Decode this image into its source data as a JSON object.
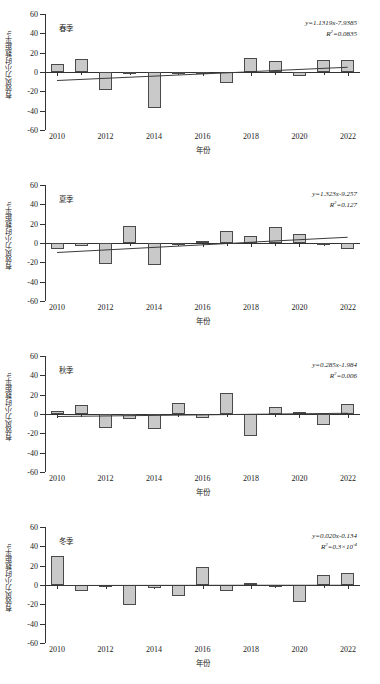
{
  "figure": {
    "y_axis_label": "有效风力小时数距平/h",
    "x_axis_label": "年份",
    "y_ticks": [
      "60",
      "40",
      "20",
      "0",
      "-20",
      "-40",
      "-60"
    ],
    "x_ticks": [
      "2010",
      "2012",
      "2014",
      "2016",
      "2018",
      "2020",
      "2022"
    ],
    "bar_fill": "#c9c9c9",
    "bar_stroke": "#4a4a4a",
    "trend_color": "#3b3b3b"
  },
  "chart_data": [
    {
      "type": "bar",
      "title": "春季",
      "equation": "y=1.1319x-7.9385",
      "r_squared_label": "R",
      "r_squared_value": "=0.0835",
      "xlabel": "年份",
      "ylabel": "有效风力小时数距平/h",
      "ylim": [
        -60,
        60
      ],
      "grid": false,
      "categories": [
        2010,
        2011,
        2012,
        2013,
        2014,
        2015,
        2016,
        2017,
        2018,
        2019,
        2020,
        2021,
        2022
      ],
      "values": [
        8,
        13,
        -19,
        0,
        -37,
        0,
        0,
        -11,
        14,
        11,
        -4,
        12,
        12
      ],
      "trend": {
        "slope": 1.1319,
        "intercept": -7.9385,
        "y_start": -7.9385,
        "y_end": 5.65
      }
    },
    {
      "type": "bar",
      "title": "夏季",
      "equation": "y=1.323x-9.257",
      "r_squared_label": "R",
      "r_squared_value": "=0.127",
      "xlabel": "年份",
      "ylabel": "有效风力小时数距平/h",
      "ylim": [
        -60,
        60
      ],
      "grid": false,
      "categories": [
        2010,
        2011,
        2012,
        2013,
        2014,
        2015,
        2016,
        2017,
        2018,
        2019,
        2020,
        2021,
        2022
      ],
      "values": [
        -6,
        -3,
        -22,
        18,
        -23,
        -1,
        2,
        12,
        7,
        17,
        9,
        -1,
        -6
      ],
      "trend": {
        "slope": 1.323,
        "intercept": -9.257,
        "y_start": -9.257,
        "y_end": 6.62
      }
    },
    {
      "type": "bar",
      "title": "秋季",
      "equation": "y=0.285x-1.984",
      "r_squared_label": "R",
      "r_squared_value": "=0.006",
      "xlabel": "年份",
      "ylabel": "有效风力小时数距平/h",
      "ylim": [
        -60,
        60
      ],
      "grid": false,
      "categories": [
        2010,
        2011,
        2012,
        2013,
        2014,
        2015,
        2016,
        2017,
        2018,
        2019,
        2020,
        2021,
        2022
      ],
      "values": [
        3,
        9,
        -14,
        -5,
        -16,
        11,
        -4,
        22,
        -23,
        7,
        2,
        -11,
        10
      ],
      "trend": {
        "slope": 0.285,
        "intercept": -1.984,
        "y_start": -1.984,
        "y_end": 1.44
      }
    },
    {
      "type": "bar",
      "title": "冬季",
      "equation": "y=0.020x-0.134",
      "r_squared_label": "R",
      "r_squared_value": "=0.3×10",
      "r_squared_exponent": "-4",
      "xlabel": "年份",
      "ylabel": "有效风力小时数距平/h",
      "ylim": [
        -60,
        60
      ],
      "grid": false,
      "categories": [
        2010,
        2011,
        2012,
        2013,
        2014,
        2015,
        2016,
        2017,
        2018,
        2019,
        2020,
        2021,
        2022
      ],
      "values": [
        30,
        -6,
        -1,
        -21,
        -3,
        -11,
        19,
        -6,
        2,
        -1,
        -18,
        10,
        12
      ],
      "trend": {
        "slope": 0.02,
        "intercept": -0.134,
        "y_start": -0.134,
        "y_end": 0.106
      }
    }
  ]
}
